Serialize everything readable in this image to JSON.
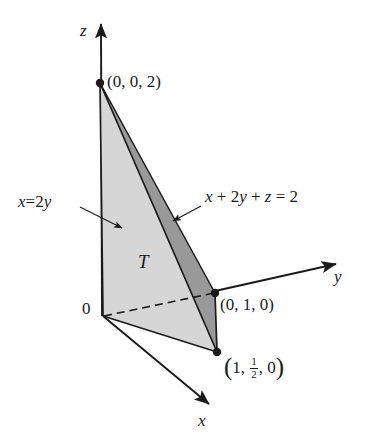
{
  "figure": {
    "type": "3d-solid-diagram",
    "background_color": "#ffffff",
    "stroke_color": "#1a1a1a",
    "fill_light": "#d6d6d6",
    "fill_dark": "#999999",
    "fill_bottom": "#c9c9c9"
  },
  "axes": [
    {
      "name": "z",
      "label": "z",
      "label_x": 80,
      "label_y": 22,
      "tip_x": 101,
      "tip_y": 19
    },
    {
      "name": "y",
      "label": "y",
      "label_x": 334,
      "label_y": 268,
      "tip_x": 342,
      "tip_y": 262
    },
    {
      "name": "x",
      "label": "x",
      "label_x": 198,
      "label_y": 412,
      "tip_x": 214,
      "tip_y": 409
    }
  ],
  "origin": {
    "label": "0",
    "label_x": 82,
    "label_y": 300,
    "point_x": 103,
    "point_y": 316
  },
  "vertices": [
    {
      "name": "vertex-z",
      "label": "(0, 0, 2)",
      "coords": [
        0,
        0,
        2
      ],
      "px": 100,
      "py": 83,
      "label_x": 107,
      "label_y": 73,
      "dot": true
    },
    {
      "name": "vertex-y",
      "label": "(0, 1, 0)",
      "coords": [
        0,
        1,
        0
      ],
      "px": 215,
      "py": 293,
      "label_x": 220,
      "label_y": 296,
      "dot": true
    },
    {
      "name": "vertex-x",
      "label_parts": {
        "open": "(",
        "first": "1",
        "num": "1",
        "den": "2",
        "last": "0",
        "close": ")"
      },
      "label": "(1, 1/2, 0)",
      "coords": [
        1,
        0.5,
        0
      ],
      "px": 217,
      "py": 352,
      "label_x": 224,
      "label_y": 355,
      "dot": true
    }
  ],
  "annotations": [
    {
      "name": "plane-x-equals-2y",
      "text": "x = 2y",
      "parts": {
        "lhs": "x",
        "eq": "=",
        "rhs_coef": "2",
        "rhs_var": "y"
      },
      "label_x": 18,
      "label_y": 193,
      "arrow_from_x": 80,
      "arrow_from_y": 207,
      "arrow_to_x": 126,
      "arrow_to_y": 231
    },
    {
      "name": "plane-equation",
      "text": "x + 2y + z = 2",
      "parts": {
        "t1": "x",
        "p1": "+",
        "t2": "2",
        "t2v": "y",
        "p2": "+",
        "t3": "z",
        "eq": "=",
        "rhs": "2"
      },
      "label_x": 205,
      "label_y": 188,
      "arrow_from_x": 201,
      "arrow_from_y": 206,
      "arrow_to_x": 170,
      "arrow_to_y": 223
    },
    {
      "name": "region-label-T",
      "text": "T",
      "label_x": 138,
      "label_y": 252
    }
  ],
  "faces": [
    {
      "name": "face-x-equals-2y",
      "fill": "#d6d6d6",
      "points": "100,83 103,316 217,352"
    },
    {
      "name": "face-plane",
      "fill": "#999999",
      "points": "100,83 217,352 215,293"
    },
    {
      "name": "face-base",
      "fill": "#c9c9c9",
      "points": "103,316 215,293 217,352"
    }
  ],
  "edges": [
    {
      "name": "edge-z-to-origin",
      "style": "solid"
    },
    {
      "name": "edge-z-to-vertex-x",
      "style": "solid"
    },
    {
      "name": "edge-z-to-vertex-y",
      "style": "solid"
    },
    {
      "name": "edge-origin-to-vertex-x",
      "style": "solid"
    },
    {
      "name": "edge-origin-to-vertex-y",
      "style": "dashed"
    },
    {
      "name": "edge-vertex-y-to-vertex-x",
      "style": "solid"
    }
  ]
}
